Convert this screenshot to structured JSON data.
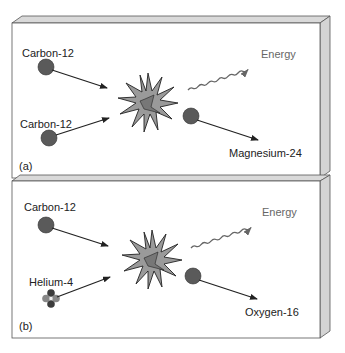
{
  "panels": [
    {
      "id": "a",
      "tag": "(a)",
      "reactant_1": "Carbon-12",
      "reactant_2": "Carbon-12",
      "energy_label": "Energy",
      "product": "Magnesium-24"
    },
    {
      "id": "b",
      "tag": "(b)",
      "reactant_1": "Carbon-12",
      "reactant_2": "Helium-4",
      "energy_label": "Energy",
      "product": "Oxygen-16"
    }
  ],
  "colors": {
    "panel_face": "#ffffff",
    "panel_edge": "#d9d9d9",
    "panel_outline": "#555555",
    "nucleus": "#5a5a5a",
    "burst": "#9a9a9a",
    "arrow": "#222222",
    "energy_wave": "#666666"
  }
}
